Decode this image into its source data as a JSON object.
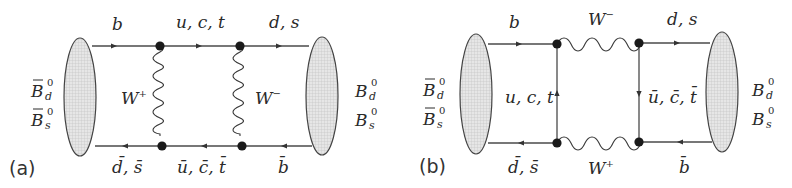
{
  "figure": {
    "panels": [
      {
        "tag": "(a)",
        "initial_state": {
          "line1_base": "B",
          "line1_sub": "d",
          "line1_sup": "0",
          "line2_base": "B",
          "line2_sub": "s",
          "line2_sup": "0",
          "bar": true
        },
        "final_state": {
          "line1_base": "B",
          "line1_sub": "d",
          "line1_sup": "0",
          "line2_base": "B",
          "line2_sub": "s",
          "line2_sup": "0",
          "bar": false
        },
        "labels": {
          "top_left_quark": "b",
          "top_mid_quark": "u, c, t",
          "top_right_quark": "d, s",
          "bottom_left_quark": "d̄, s̄",
          "bottom_mid_quark": "ū, c̄, t̄",
          "bottom_right_quark": "b̄",
          "left_boson": "W",
          "left_boson_charge": "+",
          "right_boson": "W",
          "right_boson_charge": "−"
        }
      },
      {
        "tag": "(b)",
        "initial_state": {
          "line1_base": "B",
          "line1_sub": "d",
          "line1_sup": "0",
          "line2_base": "B",
          "line2_sub": "s",
          "line2_sup": "0",
          "bar": true
        },
        "final_state": {
          "line1_base": "B",
          "line1_sub": "d",
          "line1_sup": "0",
          "line2_base": "B",
          "line2_sub": "s",
          "line2_sup": "0",
          "bar": false
        },
        "labels": {
          "top_left_quark": "b",
          "top_boson": "W",
          "top_boson_charge": "−",
          "top_right_quark": "d, s",
          "left_vertical_quark": "u, c, t",
          "right_vertical_quark": "ū, c̄, t̄",
          "bottom_left_quark": "d̄, s̄",
          "bottom_boson": "W",
          "bottom_boson_charge": "+",
          "bottom_right_quark": "b̄"
        }
      }
    ]
  }
}
